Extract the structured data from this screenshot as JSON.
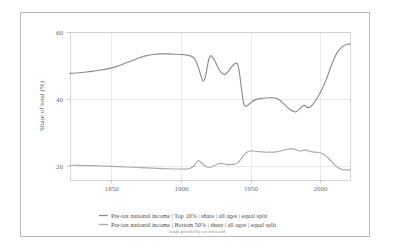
{
  "chart_data": {
    "type": "line",
    "title": "",
    "xlabel": "",
    "ylabel": "Share of total (%)",
    "xlim": [
      1820,
      2021
    ],
    "ylim": [
      10,
      60
    ],
    "xticks": [
      1850,
      1900,
      1950,
      2000
    ],
    "yticks": [
      20,
      40,
      60
    ],
    "grid": true,
    "legend_position": "bottom",
    "series": [
      {
        "name": "Pre-tax national income | Top 10% | share | all ages | equal split",
        "color": "#8c8c8c",
        "points": [
          [
            1820,
            46.0
          ],
          [
            1830,
            46.4
          ],
          [
            1840,
            47.0
          ],
          [
            1850,
            47.9
          ],
          [
            1855,
            48.6
          ],
          [
            1860,
            49.5
          ],
          [
            1865,
            50.4
          ],
          [
            1870,
            51.3
          ],
          [
            1875,
            52.0
          ],
          [
            1880,
            52.4
          ],
          [
            1885,
            52.6
          ],
          [
            1890,
            52.6
          ],
          [
            1895,
            52.5
          ],
          [
            1900,
            52.4
          ],
          [
            1902,
            52.3
          ],
          [
            1904,
            52.2
          ],
          [
            1906,
            52.0
          ],
          [
            1908,
            51.6
          ],
          [
            1910,
            50.6
          ],
          [
            1912,
            48.2
          ],
          [
            1914,
            45.2
          ],
          [
            1915,
            43.8
          ],
          [
            1916,
            43.5
          ],
          [
            1917,
            44.6
          ],
          [
            1918,
            46.8
          ],
          [
            1919,
            49.4
          ],
          [
            1920,
            51.3
          ],
          [
            1921,
            52.0
          ],
          [
            1922,
            51.6
          ],
          [
            1924,
            50.2
          ],
          [
            1926,
            48.2
          ],
          [
            1928,
            46.6
          ],
          [
            1930,
            45.8
          ],
          [
            1931,
            45.6
          ],
          [
            1932,
            45.9
          ],
          [
            1934,
            46.9
          ],
          [
            1936,
            48.2
          ],
          [
            1938,
            49.2
          ],
          [
            1939,
            49.5
          ],
          [
            1940,
            49.3
          ],
          [
            1941,
            48.0
          ],
          [
            1942,
            45.0
          ],
          [
            1943,
            41.2
          ],
          [
            1944,
            37.6
          ],
          [
            1945,
            35.5
          ],
          [
            1946,
            34.9
          ],
          [
            1947,
            35.0
          ],
          [
            1948,
            35.4
          ],
          [
            1950,
            36.2
          ],
          [
            1952,
            36.9
          ],
          [
            1955,
            37.4
          ],
          [
            1958,
            37.6
          ],
          [
            1960,
            37.7
          ],
          [
            1963,
            37.8
          ],
          [
            1966,
            37.8
          ],
          [
            1968,
            37.6
          ],
          [
            1970,
            37.2
          ],
          [
            1972,
            36.4
          ],
          [
            1974,
            35.5
          ],
          [
            1976,
            34.6
          ],
          [
            1978,
            33.8
          ],
          [
            1980,
            33.2
          ],
          [
            1982,
            33.0
          ],
          [
            1984,
            33.6
          ],
          [
            1986,
            34.6
          ],
          [
            1988,
            35.2
          ],
          [
            1989,
            35.1
          ],
          [
            1990,
            34.6
          ],
          [
            1992,
            34.5
          ],
          [
            1994,
            35.4
          ],
          [
            1996,
            36.6
          ],
          [
            1998,
            38.1
          ],
          [
            2000,
            39.8
          ],
          [
            2002,
            41.8
          ],
          [
            2004,
            44.0
          ],
          [
            2006,
            46.6
          ],
          [
            2008,
            49.2
          ],
          [
            2010,
            51.4
          ],
          [
            2012,
            53.2
          ],
          [
            2014,
            54.4
          ],
          [
            2016,
            55.2
          ],
          [
            2018,
            55.7
          ],
          [
            2020,
            55.9
          ],
          [
            2021,
            56.0
          ]
        ]
      },
      {
        "name": "Pre-tax national income | Bottom 50% | share | all ages | equal split",
        "color": "#a8a8a8",
        "points": [
          [
            1820,
            15.0
          ],
          [
            1830,
            14.9
          ],
          [
            1840,
            14.8
          ],
          [
            1850,
            14.6
          ],
          [
            1860,
            14.4
          ],
          [
            1870,
            14.2
          ],
          [
            1880,
            14.0
          ],
          [
            1890,
            13.8
          ],
          [
            1900,
            13.7
          ],
          [
            1902,
            13.7
          ],
          [
            1904,
            13.7
          ],
          [
            1906,
            13.9
          ],
          [
            1908,
            14.4
          ],
          [
            1910,
            15.4
          ],
          [
            1911,
            16.1
          ],
          [
            1912,
            16.5
          ],
          [
            1913,
            16.4
          ],
          [
            1914,
            15.9
          ],
          [
            1916,
            15.1
          ],
          [
            1918,
            14.5
          ],
          [
            1920,
            14.3
          ],
          [
            1922,
            14.5
          ],
          [
            1924,
            15.0
          ],
          [
            1926,
            15.4
          ],
          [
            1928,
            15.6
          ],
          [
            1930,
            15.5
          ],
          [
            1932,
            15.3
          ],
          [
            1934,
            15.2
          ],
          [
            1936,
            15.3
          ],
          [
            1938,
            15.3
          ],
          [
            1940,
            15.7
          ],
          [
            1942,
            16.6
          ],
          [
            1944,
            17.9
          ],
          [
            1946,
            19.0
          ],
          [
            1948,
            19.6
          ],
          [
            1950,
            19.8
          ],
          [
            1952,
            19.8
          ],
          [
            1955,
            19.6
          ],
          [
            1958,
            19.5
          ],
          [
            1960,
            19.4
          ],
          [
            1963,
            19.4
          ],
          [
            1966,
            19.4
          ],
          [
            1968,
            19.5
          ],
          [
            1970,
            19.7
          ],
          [
            1972,
            19.9
          ],
          [
            1974,
            20.2
          ],
          [
            1976,
            20.4
          ],
          [
            1978,
            20.5
          ],
          [
            1980,
            20.5
          ],
          [
            1982,
            20.3
          ],
          [
            1984,
            19.9
          ],
          [
            1985,
            19.8
          ],
          [
            1986,
            19.9
          ],
          [
            1988,
            20.1
          ],
          [
            1989,
            20.1
          ],
          [
            1990,
            20.0
          ],
          [
            1992,
            19.7
          ],
          [
            1994,
            19.5
          ],
          [
            1996,
            19.4
          ],
          [
            1998,
            19.3
          ],
          [
            2000,
            19.1
          ],
          [
            2002,
            18.7
          ],
          [
            2004,
            18.0
          ],
          [
            2006,
            17.1
          ],
          [
            2008,
            16.1
          ],
          [
            2010,
            15.1
          ],
          [
            2012,
            14.3
          ],
          [
            2014,
            13.8
          ],
          [
            2016,
            13.5
          ],
          [
            2018,
            13.4
          ],
          [
            2020,
            13.4
          ],
          [
            2021,
            13.4
          ]
        ]
      }
    ]
  },
  "axis": {
    "ylabel": "Share of total (%)",
    "yticks": [
      "60",
      "40",
      "20"
    ],
    "xticks": [
      "1850",
      "1900",
      "1950",
      "2000"
    ]
  },
  "legend": {
    "items": [
      {
        "label": "Pre-tax national income | Top 10% | share | all ages | equal split",
        "color": "#8c8c8c"
      },
      {
        "label": "Pre-tax national income | Bottom 50% | share | all ages | equal split",
        "color": "#a8a8a8"
      }
    ]
  },
  "credit": {
    "text": "Graph provided by wir.wid.world"
  }
}
